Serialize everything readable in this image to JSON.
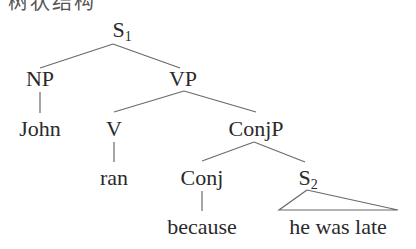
{
  "header": {
    "text": "树状结构"
  },
  "tree": {
    "root": {
      "label": "S",
      "subscript": "1"
    },
    "np": {
      "label": "NP"
    },
    "vp": {
      "label": "VP"
    },
    "john": {
      "label": "John"
    },
    "v": {
      "label": "V"
    },
    "conjp": {
      "label": "ConjP"
    },
    "ran": {
      "label": "ran"
    },
    "conj": {
      "label": "Conj"
    },
    "s2": {
      "label": "S",
      "subscript": "2"
    },
    "because": {
      "label": "because"
    },
    "he_was_late": {
      "label": "he was late"
    }
  },
  "colors": {
    "text": "#2a2a2a",
    "edge": "#6a6a6a",
    "background": "#ffffff"
  }
}
